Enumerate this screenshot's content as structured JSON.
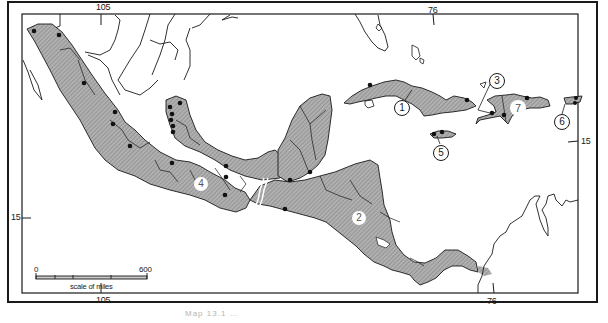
{
  "map": {
    "title": "Map of Mexico, Central America and the Greater Antilles with shaded regions and numbered areas",
    "colors": {
      "land_shaded": "#a8a8a8",
      "land_unshaded": "#ffffff",
      "sea": "#ffffff",
      "ink": "#1a1a1a",
      "dot": "#111111"
    },
    "graticule": {
      "top": [
        {
          "label": "105",
          "x": 101
        },
        {
          "label": "76",
          "x": 432
        }
      ],
      "bottom": [
        {
          "label": "105",
          "x": 101
        },
        {
          "label": "76",
          "x": 492
        }
      ],
      "left": [
        {
          "label": "15",
          "y": 217
        }
      ],
      "right": [
        {
          "label": "15",
          "y": 141
        }
      ]
    },
    "regions": [
      {
        "number": "1",
        "name": "Cuba"
      },
      {
        "number": "2",
        "name": "Honduras / Nicaragua region"
      },
      {
        "number": "3",
        "name": "Haiti (north-west pointer)"
      },
      {
        "number": "4",
        "name": "Southern Mexico / Oaxaca region"
      },
      {
        "number": "5",
        "name": "Jamaica"
      },
      {
        "number": "6",
        "name": "Puerto Rico"
      },
      {
        "number": "7",
        "name": "Hispaniola"
      }
    ],
    "scale_bar": {
      "start": "0",
      "end": "600",
      "unit_label": "scale of miles"
    },
    "caption": "Map 13.1 …"
  }
}
